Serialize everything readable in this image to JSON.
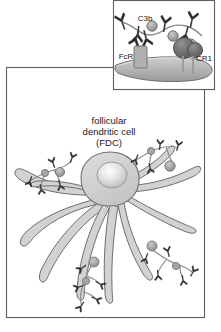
{
  "figure": {
    "type": "biology-diagram",
    "background_color": "#ffffff",
    "outline_color": "#6e6e6e",
    "fill_light": "#d9d9d9",
    "fill_mid": "#bdbdbd",
    "fill_dark": "#8c8c8c",
    "fill_darker": "#6b6b6b",
    "text_color": "#1a1a1a"
  },
  "inset_panel": {
    "title": "",
    "labels": {
      "c3b": "C3b",
      "fcr": "FcR",
      "cr1": "CR1"
    },
    "elements": {
      "membrane": "cell-membrane",
      "antibody": "antibody-y-shape",
      "antigen": "antigen-complex",
      "complement": "complement-c3b-sphere"
    }
  },
  "main_panel": {
    "cell_label_lines": [
      "follicular",
      "dendritic cell",
      "(FDC)"
    ],
    "cell_label_full": "follicular dendritic cell (FDC)",
    "elements": {
      "cell_body": "fdc-cell-body",
      "nucleus": "fdc-nucleus",
      "processes": "dendritic-processes",
      "immune_complexes": "immune-complex-cluster"
    },
    "immune_complex_count": 4
  }
}
